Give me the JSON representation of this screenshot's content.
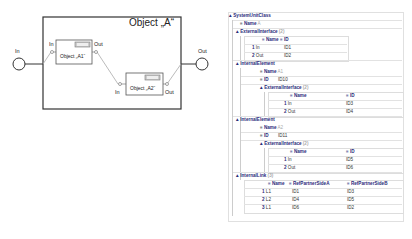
{
  "diagram": {
    "outer_title": "Object „A“",
    "outer_in_label": "In",
    "outer_out_label": "Out",
    "a1": {
      "title": "Object „A1“",
      "in_label": "In",
      "out_label": "Out"
    },
    "a2": {
      "title": "Object „A2“",
      "in_label": "In",
      "out_label": "Out"
    }
  },
  "tree": {
    "root": "SystemUnitClass",
    "name_label": "Name",
    "name_value": "A",
    "ext_interface": {
      "label": "ExternalInterface",
      "count": "(2)",
      "headers": [
        "Name",
        "ID"
      ],
      "rows": [
        {
          "idx": "1",
          "name": "In",
          "id": "ID1"
        },
        {
          "idx": "2",
          "name": "Out",
          "id": "ID2"
        }
      ]
    },
    "internal_elements": [
      {
        "label": "InternalElement",
        "name_label": "Name",
        "name_value": "A1",
        "id_label": "ID",
        "id_value": "ID10",
        "ext_label": "ExternalInterface",
        "ext_count": "(2)",
        "headers": [
          "Name",
          "ID"
        ],
        "rows": [
          {
            "idx": "1",
            "name": "In",
            "id": "ID3"
          },
          {
            "idx": "2",
            "name": "Out",
            "id": "ID4"
          }
        ]
      },
      {
        "label": "InternalElement",
        "name_label": "Name",
        "name_value": "A2",
        "id_label": "ID",
        "id_value": "ID11",
        "ext_label": "ExternalInterface",
        "ext_count": "(2)",
        "headers": [
          "Name",
          "ID"
        ],
        "rows": [
          {
            "idx": "1",
            "name": "In",
            "id": "ID5"
          },
          {
            "idx": "2",
            "name": "Out",
            "id": "ID6"
          }
        ]
      }
    ],
    "internal_link": {
      "label": "InternalLink",
      "count": "(3)",
      "headers": [
        "Name",
        "RefPartnerSideA",
        "RefPartnerSideB"
      ],
      "rows": [
        {
          "idx": "1",
          "name": "L1",
          "a": "ID1",
          "b": "ID3"
        },
        {
          "idx": "2",
          "name": "L2",
          "a": "ID4",
          "b": "ID5"
        },
        {
          "idx": "3",
          "name": "L1",
          "a": "ID6",
          "b": "ID2"
        }
      ]
    }
  }
}
